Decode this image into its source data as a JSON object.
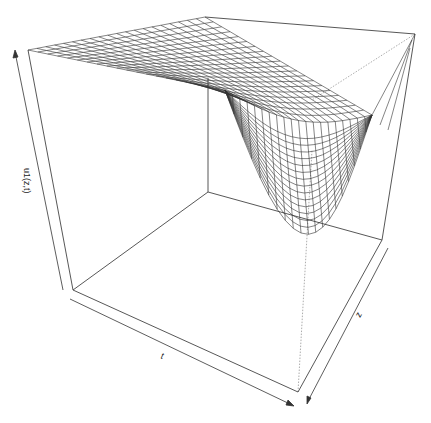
{
  "chart_data": {
    "type": "surface",
    "title": "",
    "xlabel": "t",
    "ylabel": "z",
    "zlabel": "u1(z,t)",
    "ticks": "none (arrow axes)",
    "box": true,
    "grid": "wireframe mesh, ~20x20",
    "colors": {
      "surface_lines": "#333333",
      "box": "#444444",
      "background": "#ffffff"
    }
  },
  "axes": {
    "x_label": "t",
    "y_label": "z",
    "z_label": "u1(z,t)"
  }
}
